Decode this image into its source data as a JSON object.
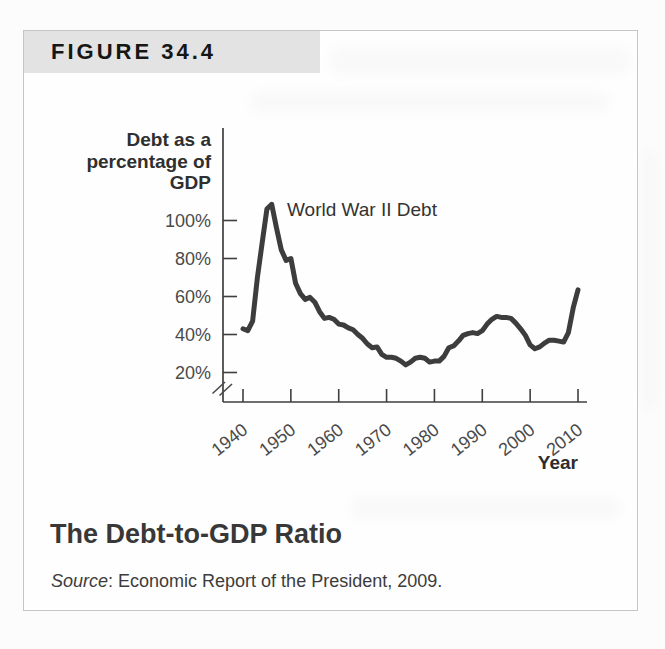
{
  "figure": {
    "header_label": "FIGURE 34.4",
    "caption_title": "The Debt-to-GDP Ratio",
    "source_label": "Source",
    "source_rest": ": Economic Report of the President, 2009."
  },
  "chart_data": {
    "type": "line",
    "title": "",
    "ylabel": "Debt as a percentage of GDP",
    "ylabel_lines": [
      "Debt as a",
      "percentage of",
      "GDP"
    ],
    "xlabel": "Year",
    "annotation": "World War II Debt",
    "y_ticks": [
      100,
      80,
      60,
      40,
      20
    ],
    "y_tick_suffix": "%",
    "x_ticks": [
      1940,
      1950,
      1960,
      1970,
      1980,
      1990,
      2000,
      2010
    ],
    "xlim": [
      1940,
      2010
    ],
    "ylim": [
      20,
      110
    ],
    "axis_break_at_origin": true,
    "grid": false,
    "legend": "none",
    "series": [
      {
        "name": "Debt as a percentage of GDP",
        "x": [
          1940,
          1941,
          1942,
          1943,
          1944,
          1945,
          1946,
          1947,
          1948,
          1949,
          1950,
          1951,
          1952,
          1953,
          1954,
          1955,
          1956,
          1957,
          1958,
          1959,
          1960,
          1961,
          1962,
          1963,
          1964,
          1965,
          1966,
          1967,
          1968,
          1969,
          1970,
          1971,
          1972,
          1973,
          1974,
          1975,
          1976,
          1977,
          1978,
          1979,
          1980,
          1981,
          1982,
          1983,
          1984,
          1985,
          1986,
          1987,
          1988,
          1989,
          1990,
          1991,
          1992,
          1993,
          1994,
          1995,
          1996,
          1997,
          1998,
          1999,
          2000,
          2001,
          2002,
          2003,
          2004,
          2005,
          2006,
          2007,
          2008,
          2009,
          2010
        ],
        "values": [
          43,
          42,
          47,
          70,
          88,
          106,
          108.5,
          96,
          84.5,
          79,
          80,
          67,
          61.5,
          58.5,
          59.5,
          57,
          52,
          48.5,
          49,
          48,
          45.5,
          45,
          43.5,
          42.5,
          40,
          38,
          35,
          33,
          33.5,
          29.5,
          28,
          28,
          27.5,
          26,
          24,
          25.5,
          27.5,
          28,
          27.5,
          25.5,
          26,
          26,
          28.5,
          33,
          34,
          36.5,
          39.5,
          40.5,
          41,
          40.5,
          42,
          45.5,
          48,
          49.5,
          49,
          49,
          48.5,
          46,
          43,
          39.5,
          34.5,
          32.5,
          33.5,
          35.5,
          37,
          37,
          36.5,
          36,
          41,
          54,
          63.5
        ]
      }
    ]
  },
  "colors": {
    "page_bg": "#fcfcfc",
    "box_border": "#c6c6c6",
    "header_bar_bg": "#e3e3e3",
    "header_text": "#161616",
    "axis": "#3f3f3f",
    "tick_text": "#4a4a4a",
    "line": "#3d3d3d",
    "annotation_text": "#333333",
    "title_text": "#383838",
    "source_text": "#3c3c3c"
  }
}
